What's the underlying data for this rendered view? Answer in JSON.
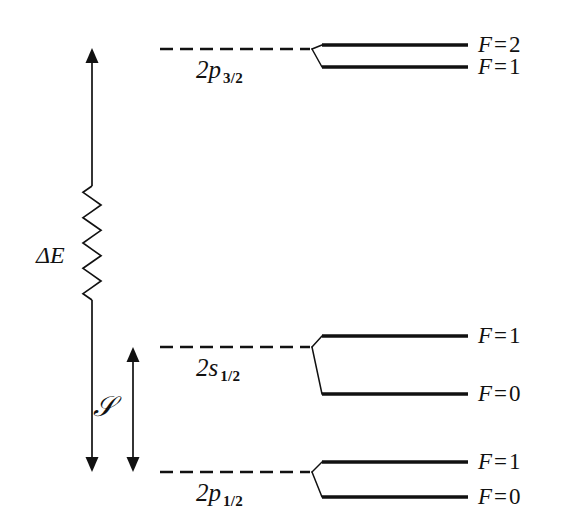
{
  "figure": {
    "background_color": "#ffffff",
    "line_color": "#111111"
  },
  "arrows": {
    "delta_e": {
      "label": "ΔE",
      "name": "delta-e-arrow",
      "description": "double headed vertical arrow with zigzag break spanning 2p_3/2 down to 2p_1/2",
      "top_y": 48,
      "bottom_y": 472,
      "x": 92,
      "zigzag_top_y": 186,
      "zigzag_bottom_y": 300,
      "zigzag_segments": 9,
      "zigzag_amplitude": 9
    },
    "lamb_shift": {
      "label": "ℒ",
      "label_unicode": "𝒮",
      "name": "lamb-shift-arrow",
      "description": "double headed vertical arrow spanning 2s_1/2 down to 2p_1/2",
      "top_y": 347,
      "bottom_y": 472,
      "x": 133
    }
  },
  "levels": [
    {
      "id": "2p32",
      "term_base": "2p",
      "term_sub": "3/2",
      "dash_y": 49,
      "dash_x1": 160,
      "dash_x2": 310,
      "term_label_x": 196,
      "term_label_y": 57,
      "split_origin_x": 312,
      "solid_x1": 322,
      "solid_x2": 468,
      "sublevels": [
        {
          "label_f": "F",
          "label_eq": "=",
          "label_num": "2",
          "y": 45,
          "label_x": 478,
          "label_y": 33
        },
        {
          "label_f": "F",
          "label_eq": "=",
          "label_num": "1",
          "y": 67,
          "label_x": 478,
          "label_y": 55
        }
      ]
    },
    {
      "id": "2s12",
      "term_base": "2s",
      "term_sub": "1/2",
      "dash_y": 347,
      "dash_x1": 160,
      "dash_x2": 310,
      "term_label_x": 196,
      "term_label_y": 355,
      "split_origin_x": 312,
      "solid_x1": 322,
      "solid_x2": 468,
      "sublevels": [
        {
          "label_f": "F",
          "label_eq": "=",
          "label_num": "1",
          "y": 336,
          "label_x": 478,
          "label_y": 324
        },
        {
          "label_f": "F",
          "label_eq": "=",
          "label_num": "0",
          "y": 394,
          "label_x": 478,
          "label_y": 382
        }
      ]
    },
    {
      "id": "2p12",
      "term_base": "2p",
      "term_sub": "1/2",
      "dash_y": 472,
      "dash_x1": 160,
      "dash_x2": 310,
      "term_label_x": 196,
      "term_label_y": 480,
      "split_origin_x": 312,
      "solid_x1": 322,
      "solid_x2": 468,
      "sublevels": [
        {
          "label_f": "F",
          "label_eq": "=",
          "label_num": "1",
          "y": 462,
          "label_x": 478,
          "label_y": 450
        },
        {
          "label_f": "F",
          "label_eq": "=",
          "label_num": "0",
          "y": 497,
          "label_x": 478,
          "label_y": 485
        }
      ]
    }
  ],
  "chart_data": {
    "type": "diagram",
    "xlabel": "",
    "ylabel": "Energy",
    "grid": false,
    "legend": "none",
    "states": [
      {
        "term": "2p_3/2",
        "hyperfine": [
          {
            "F": 2,
            "relative_y": 45
          },
          {
            "F": 1,
            "relative_y": 67
          }
        ]
      },
      {
        "term": "2s_1/2",
        "hyperfine": [
          {
            "F": 1,
            "relative_y": 336
          },
          {
            "F": 0,
            "relative_y": 394
          }
        ]
      },
      {
        "term": "2p_1/2",
        "hyperfine": [
          {
            "F": 1,
            "relative_y": 462
          },
          {
            "F": 0,
            "relative_y": 497
          }
        ]
      }
    ],
    "annotations": [
      {
        "symbol": "ΔE",
        "meaning": "fine structure splitting 2p_3/2 to 2p_1/2",
        "from_term": "2p_3/2",
        "to_term": "2p_1/2"
      },
      {
        "symbol": "𝒮",
        "meaning": "Lamb shift 2s_1/2 to 2p_1/2",
        "from_term": "2s_1/2",
        "to_term": "2p_1/2"
      }
    ]
  }
}
